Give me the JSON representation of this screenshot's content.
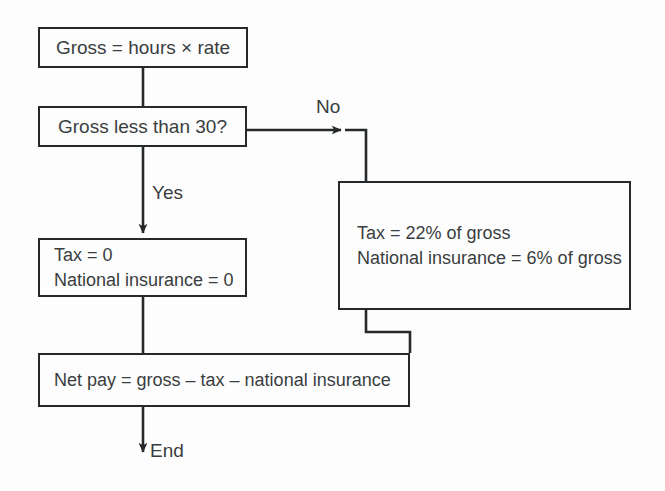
{
  "diagram": {
    "type": "flowchart",
    "background_color": "#fdfdfd",
    "line_color": "#26292b",
    "text_color": "#3a3d40",
    "nodes": [
      {
        "id": "gross",
        "shape": "rectangle",
        "align": "center",
        "lines": [
          "Gross = hours × rate"
        ]
      },
      {
        "id": "decision",
        "shape": "rectangle",
        "align": "center",
        "lines": [
          "Gross less than 30?"
        ]
      },
      {
        "id": "zero_tax",
        "shape": "rectangle",
        "align": "left",
        "lines": [
          "Tax = 0",
          "National insurance = 0"
        ]
      },
      {
        "id": "pct_tax",
        "shape": "rectangle",
        "align": "left",
        "lines": [
          "Tax = 22% of gross",
          "National insurance = 6% of gross"
        ]
      },
      {
        "id": "netpay",
        "shape": "rectangle",
        "align": "left",
        "lines": [
          "Net pay = gross – tax – national insurance"
        ]
      }
    ],
    "edge_labels": {
      "no": "No",
      "yes": "Yes",
      "end": "End"
    }
  }
}
